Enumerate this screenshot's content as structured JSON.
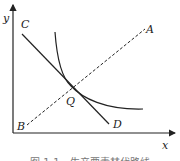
{
  "diagram": {
    "axes": {
      "x_label": "x",
      "y_label": "y"
    },
    "points": {
      "A": "A",
      "B": "B",
      "C": "C",
      "D": "D",
      "Q": "Q"
    },
    "elements": [
      {
        "name": "budget-line",
        "from": "C",
        "to": "D",
        "style": "solid"
      },
      {
        "name": "ray",
        "from": "B",
        "to": "A",
        "style": "dashed"
      },
      {
        "name": "indifference-curve",
        "tangent_at": "Q",
        "style": "solid"
      }
    ],
    "caption": "图 1-1　生产要素替代路线"
  },
  "colors": {
    "line": "#222222",
    "caption": "#777777",
    "background": "#ffffff"
  }
}
